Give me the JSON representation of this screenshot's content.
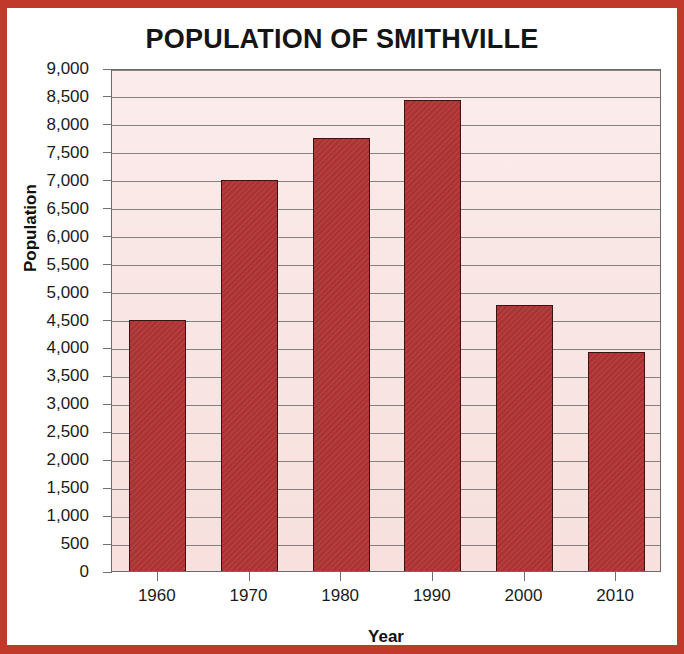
{
  "chart_data": {
    "type": "bar",
    "title": "POPULATION OF SMITHVILLE",
    "xlabel": "Year",
    "ylabel": "Population",
    "categories": [
      "1960",
      "1970",
      "1980",
      "1990",
      "2000",
      "2010"
    ],
    "values": [
      4500,
      7000,
      7750,
      8425,
      4760,
      3920
    ],
    "ylim": [
      0,
      9000
    ],
    "ytick_step": 500,
    "ytick_labels": [
      "9,000",
      "8,500",
      "8,000",
      "7,500",
      "7,000",
      "6,500",
      "6,000",
      "5,500",
      "5,000",
      "4,500",
      "4,000",
      "3,500",
      "3,000",
      "2,500",
      "2,000",
      "1,500",
      "1,000",
      "500",
      "0"
    ],
    "ytick_values": [
      9000,
      8500,
      8000,
      7500,
      7000,
      6500,
      6000,
      5500,
      5000,
      4500,
      4000,
      3500,
      3000,
      2500,
      2000,
      1500,
      1000,
      500,
      0
    ],
    "grid": true,
    "legend": false,
    "bar_color": "#b03434",
    "bar_edge_color": "#3a1211",
    "plot_background": "#f9e6e4",
    "frame_color": "#c0392b",
    "axis_color": "#6f6f6f"
  }
}
